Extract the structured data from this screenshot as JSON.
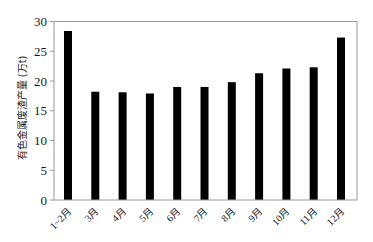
{
  "chart_data": {
    "type": "bar",
    "title": "",
    "xlabel": "",
    "ylabel": "有色金属废渣产量 (万t)",
    "categories": [
      "1~2月",
      "3月",
      "4月",
      "5月",
      "6月",
      "7月",
      "8月",
      "9月",
      "10月",
      "11月",
      "12月"
    ],
    "values": [
      28.4,
      18.2,
      18.1,
      17.9,
      19.0,
      19.0,
      19.8,
      21.3,
      22.1,
      22.3,
      27.3
    ],
    "ylim": [
      0,
      30
    ],
    "yticks": [
      0,
      5,
      10,
      15,
      20,
      25,
      30
    ],
    "grid": false,
    "legend": null,
    "bar_color": "#000000"
  }
}
